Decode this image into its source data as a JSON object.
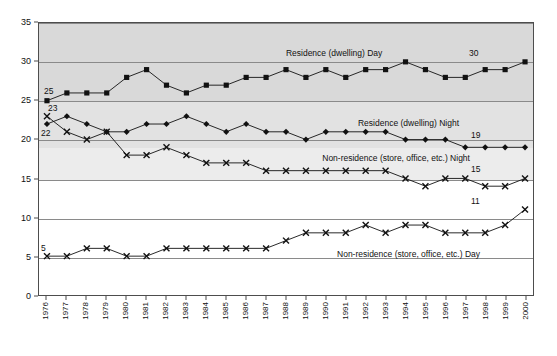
{
  "chart_data": {
    "type": "line",
    "title": "",
    "xlabel": "",
    "ylabel": "",
    "ylim": [
      0,
      35
    ],
    "ytick_values": [
      0,
      5,
      10,
      15,
      20,
      25,
      30,
      35
    ],
    "ytick_labels": [
      "0",
      "5",
      "10",
      "15",
      "20",
      "25",
      "30",
      "35"
    ],
    "grid": true,
    "legend_position": "inline-annotations",
    "categories": [
      "1976",
      "1977",
      "1978",
      "1979",
      "1980",
      "1981",
      "1982",
      "1983",
      "1984",
      "1985",
      "1986",
      "1987",
      "1988",
      "1989",
      "1990",
      "1991",
      "1992",
      "1993",
      "1994",
      "1995",
      "1996",
      "1997",
      "1998",
      "1999",
      "2000"
    ],
    "series": [
      {
        "name": "Residence (dwelling) Day",
        "marker": "square",
        "color": "#111111",
        "values": [
          25,
          26,
          26,
          26,
          28,
          29,
          27,
          26,
          27,
          27,
          28,
          28,
          29,
          28,
          29,
          28,
          29,
          29,
          30,
          29,
          28,
          28,
          29,
          29,
          30
        ],
        "start_label": "25",
        "end_label": "30",
        "annotation": "Residence (dwelling) Day"
      },
      {
        "name": "Residence (dwelling) Night",
        "marker": "diamond",
        "color": "#111111",
        "values": [
          22,
          23,
          22,
          21,
          21,
          22,
          22,
          23,
          22,
          21,
          22,
          21,
          21,
          20,
          21,
          21,
          21,
          21,
          20,
          20,
          20,
          19,
          19,
          19,
          19
        ],
        "start_label": "22",
        "end_label": "19",
        "annotation": "Residence (dwelling) Night"
      },
      {
        "name": "Non-residence (store, office, etc.) Night",
        "marker": "cross",
        "color": "#111111",
        "values": [
          23,
          21,
          20,
          21,
          18,
          18,
          19,
          18,
          17,
          17,
          17,
          16,
          16,
          16,
          16,
          16,
          16,
          16,
          15,
          14,
          15,
          15,
          14,
          14,
          15
        ],
        "start_label": "23",
        "end_label": "15",
        "annotation": "Non-residence (store, office, etc.) Night"
      },
      {
        "name": "Non-residence (store, office, etc.) Day",
        "marker": "cross",
        "color": "#111111",
        "values": [
          5,
          5,
          6,
          6,
          5,
          5,
          6,
          6,
          6,
          6,
          6,
          6,
          7,
          8,
          8,
          8,
          9,
          8,
          9,
          9,
          8,
          8,
          8,
          9,
          11
        ],
        "start_label": "5",
        "end_label": "11",
        "annotation": "Non-residence (store, office, etc.) Day"
      }
    ],
    "bands": [
      {
        "from": 19,
        "to": 25,
        "shade": "#e2e2e2"
      },
      {
        "from": 25,
        "to": 32,
        "shade": "#d9d9d9"
      },
      {
        "from": 32,
        "to": 35,
        "shade": "#d9d9d9"
      },
      {
        "from": 15,
        "to": 19,
        "shade": "#ececec"
      }
    ],
    "annotation_positions": [
      {
        "series": 0,
        "x_frac": 0.595,
        "y_value": 31.2
      },
      {
        "series": 1,
        "x_frac": 0.745,
        "y_value": 22.2
      },
      {
        "series": 2,
        "x_frac": 0.72,
        "y_value": 17.7
      },
      {
        "series": 3,
        "x_frac": 0.745,
        "y_value": 5.5
      }
    ],
    "endpoint_label_positions": [
      {
        "text": "25",
        "x_px": 43,
        "y_value": 26.3,
        "align": "left"
      },
      {
        "text": "30",
        "x_px": 468,
        "y_value": 31.2,
        "align": "left"
      },
      {
        "text": "23",
        "x_px": 47,
        "y_value": 24.1,
        "align": "left"
      },
      {
        "text": "22",
        "x_px": 40,
        "y_value": 20.9,
        "align": "left"
      },
      {
        "text": "19",
        "x_px": 470,
        "y_value": 20.7,
        "align": "left"
      },
      {
        "text": "15",
        "x_px": 470,
        "y_value": 16.3,
        "align": "left"
      },
      {
        "text": "11",
        "x_px": 470,
        "y_value": 12.2,
        "align": "left"
      },
      {
        "text": "5",
        "x_px": 40,
        "y_value": 6.3,
        "align": "left"
      }
    ]
  }
}
